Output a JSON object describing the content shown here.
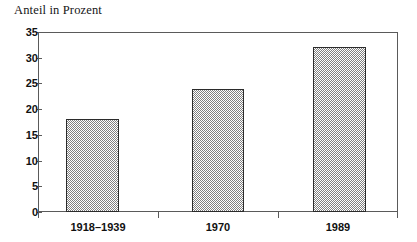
{
  "chart_data": {
    "type": "bar",
    "title": "",
    "ylabel": "Anteil in Prozent",
    "xlabel": "",
    "categories": [
      "1918–1939",
      "1970",
      "1989"
    ],
    "values": [
      18,
      24,
      32
    ],
    "ylim": [
      0,
      35
    ],
    "yticks": [
      "0",
      "5",
      "10",
      "15",
      "20",
      "25",
      "30",
      "35"
    ],
    "ytick_values": [
      0,
      5,
      10,
      15,
      20,
      25,
      30,
      35
    ],
    "grid": false,
    "legend": null,
    "bar_fill": "#808080",
    "bar_fill_style": "50% checkerboard dither",
    "bar_edge_color": "#2b2b2b",
    "axis_color": "#5a5a5a",
    "background": "#ffffff"
  },
  "axes": {
    "y_title": "Anteil in Prozent"
  }
}
